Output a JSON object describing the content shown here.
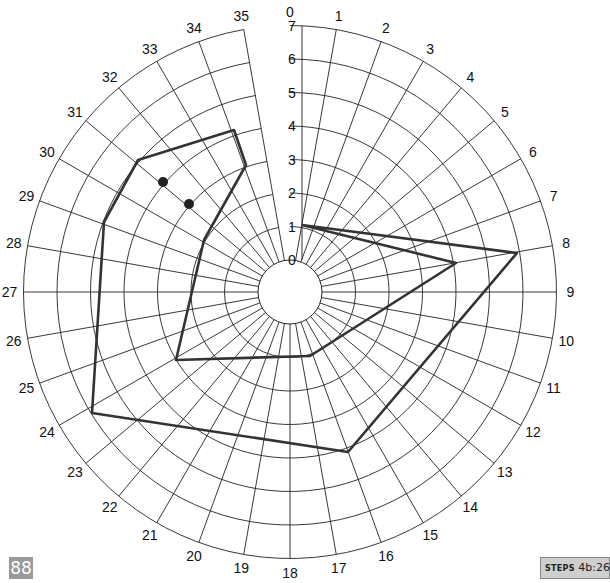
{
  "chart_data": {
    "type": "polar-line",
    "title": "",
    "center": [
      290,
      292
    ],
    "inner_radius": 32,
    "ring_step": 33.5,
    "radial_axis": {
      "min": 0,
      "max": 7,
      "ticks": [
        "0",
        "1",
        "2",
        "3",
        "4",
        "5",
        "6",
        "7"
      ],
      "label_x": 292
    },
    "angular_axis": {
      "direction": "clockwise",
      "zero_at": "top",
      "degrees_per_step": 10,
      "ticks": [
        "0",
        "1",
        "2",
        "3",
        "4",
        "5",
        "6",
        "7",
        "8",
        "9",
        "10",
        "11",
        "12",
        "13",
        "14",
        "15",
        "16",
        "17",
        "18",
        "19",
        "20",
        "21",
        "22",
        "23",
        "24",
        "25",
        "26",
        "27",
        "28",
        "29",
        "30",
        "31",
        "32",
        "33",
        "34",
        "35"
      ]
    },
    "grid": true,
    "series": [
      {
        "name": "outer",
        "color": "#333333",
        "points_px": [
          [
            302,
            225
          ],
          [
            517,
            253
          ],
          [
            348,
            452
          ],
          [
            92,
            413
          ],
          [
            104,
            222
          ],
          [
            138,
            160
          ],
          [
            234,
            130
          ],
          [
            246,
            165
          ],
          [
            204,
            240
          ],
          [
            190,
            300
          ],
          [
            176,
            360
          ],
          [
            310,
            356
          ],
          [
            456,
            263
          ],
          [
            302,
            225
          ]
        ],
        "polar_estimate": [
          {
            "spoke": 0,
            "r": 1
          },
          {
            "spoke": 8,
            "r": 6.5
          },
          {
            "spoke": 15,
            "r": 5
          },
          {
            "spoke": 24,
            "r": 5.5
          }
        ]
      }
    ],
    "markers": [
      {
        "px": [
          163,
          182
        ],
        "shape": "dot",
        "color": "#222222"
      },
      {
        "px": [
          189,
          204
        ],
        "shape": "dot",
        "color": "#222222"
      }
    ]
  },
  "footer": {
    "page_number": "88",
    "steps_label_small": "STEPS",
    "steps_value": "4b:26"
  }
}
